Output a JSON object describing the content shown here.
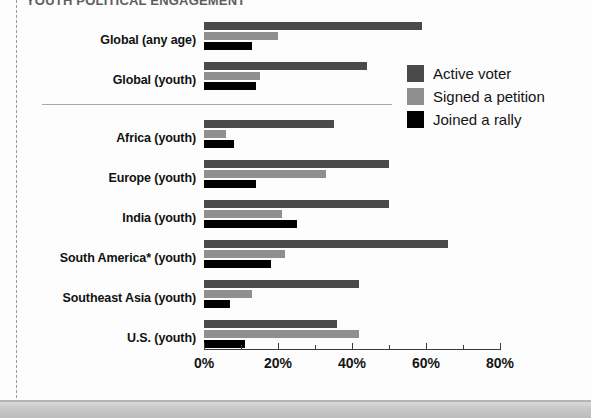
{
  "figure": {
    "clipped_title": "YOUTH POLITICAL ENGAGEMENT",
    "footnote_marker": "*"
  },
  "chart_data": {
    "type": "bar",
    "orientation": "horizontal",
    "title": "",
    "xlabel": "",
    "ylabel": "",
    "xlim": [
      0,
      80
    ],
    "xticks": [
      0,
      20,
      40,
      60,
      80
    ],
    "xtick_labels": [
      "0%",
      "20%",
      "40%",
      "60%",
      "80%"
    ],
    "minor_ticks": [
      10,
      30,
      50,
      70
    ],
    "grid": false,
    "legend_position": "right",
    "categories": [
      "Global (any age)",
      "Global (youth)",
      "Africa (youth)",
      "Europe (youth)",
      "India (youth)",
      "South America* (youth)",
      "Southeast Asia (youth)",
      "U.S. (youth)"
    ],
    "series": [
      {
        "name": "Active voter",
        "color": "#4a4a4a",
        "values": [
          59,
          44,
          35,
          50,
          50,
          66,
          42,
          36
        ]
      },
      {
        "name": "Signed a petition",
        "color": "#8f8f8f",
        "values": [
          20,
          15,
          6,
          33,
          21,
          22,
          13,
          42
        ]
      },
      {
        "name": "Joined a rally",
        "color": "#000000",
        "values": [
          13,
          14,
          8,
          14,
          25,
          18,
          7,
          11
        ]
      }
    ],
    "separator_after_category_index": 1
  }
}
